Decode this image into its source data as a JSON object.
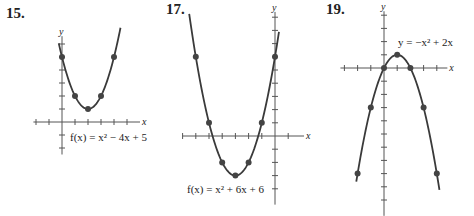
{
  "colors": {
    "curve": "#3a3a3a",
    "axis": "#555555",
    "point": "#444444",
    "text": "#222222"
  },
  "chart_data": [
    {
      "type": "line",
      "problem": "15.",
      "title": "f(x) = x² − 4x + 5",
      "equation": {
        "a": 1,
        "b": -4,
        "c": 5
      },
      "xlabel": "x",
      "ylabel": "y",
      "xlim": [
        -2,
        5
      ],
      "ylim": [
        -2,
        6.5
      ],
      "points": [
        [
          0,
          5
        ],
        [
          1,
          2
        ],
        [
          2,
          1
        ],
        [
          3,
          2
        ],
        [
          4,
          5
        ]
      ],
      "layout": {
        "ox": 62,
        "oy": 122,
        "unit": 13,
        "xmin": -2.2,
        "xmax": 6.0,
        "ymin": -2.5,
        "ymax": 6.6,
        "curve_x": [
          -0.25,
          4.5
        ],
        "label_x": 70,
        "label_y": 141,
        "num_x": 6,
        "num_y": 5
      }
    },
    {
      "type": "line",
      "problem": "17.",
      "title": "f(x) = x² + 6x + 6",
      "equation": {
        "a": 1,
        "b": 6,
        "c": 6
      },
      "xlabel": "x",
      "ylabel": "y",
      "xlim": [
        -7,
        2
      ],
      "ylim": [
        -5,
        8
      ],
      "points": [
        [
          -6,
          6
        ],
        [
          -5,
          1
        ],
        [
          -4,
          -2
        ],
        [
          -3,
          -3
        ],
        [
          -2,
          -2
        ],
        [
          -1,
          1
        ],
        [
          0,
          6
        ]
      ],
      "layout": {
        "ox": 275,
        "oy": 136,
        "unit": 13.2,
        "xmin": -7.0,
        "xmax": 2.2,
        "ymin": -5.2,
        "ymax": 9.4,
        "curve_x": [
          -6.5,
          0.3
        ],
        "label_x": 187,
        "label_y": 193,
        "num_x": 166,
        "num_y": 1
      }
    },
    {
      "type": "line",
      "problem": "19.",
      "title": "y = −x² + 2x",
      "equation": {
        "a": -1,
        "b": 2,
        "c": 0
      },
      "xlabel": "x",
      "ylabel": "y",
      "xlim": [
        -3,
        6
      ],
      "ylim": [
        -11,
        4
      ],
      "points": [
        [
          -1,
          -3
        ],
        [
          0,
          0
        ],
        [
          1,
          1
        ],
        [
          2,
          0
        ],
        [
          3,
          -3
        ],
        [
          -2,
          -8
        ],
        [
          4,
          -8
        ]
      ],
      "layout": {
        "ox": 384,
        "oy": 68,
        "unit": 13.2,
        "xmin": -3.3,
        "xmax": 4.8,
        "ymin": -11.2,
        "ymax": 4.3,
        "curve_x": [
          -2.1,
          4.2
        ],
        "label_x": 398,
        "label_y": 46,
        "num_x": 326,
        "num_y": 1
      }
    }
  ]
}
